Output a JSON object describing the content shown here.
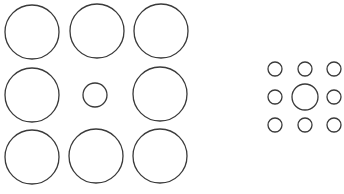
{
  "diagram": {
    "type": "ebbinghaus-illusion",
    "stroke_color": "#3a3a3a",
    "background": "#ffffff",
    "left_group": {
      "center_circle": {
        "cx": 95,
        "cy": 95,
        "r": 12
      },
      "surrounding_circles": [
        {
          "cx": 32,
          "cy": 32,
          "r": 27
        },
        {
          "cx": 97,
          "cy": 31,
          "r": 27
        },
        {
          "cx": 161,
          "cy": 31,
          "r": 27
        },
        {
          "cx": 32,
          "cy": 95,
          "r": 27
        },
        {
          "cx": 160,
          "cy": 94,
          "r": 27
        },
        {
          "cx": 32,
          "cy": 157,
          "r": 27
        },
        {
          "cx": 96,
          "cy": 156,
          "r": 27
        },
        {
          "cx": 160,
          "cy": 156,
          "r": 27
        }
      ]
    },
    "right_group": {
      "center_circle": {
        "cx": 305,
        "cy": 97,
        "r": 13
      },
      "surrounding_circles": [
        {
          "cx": 275,
          "cy": 69,
          "r": 7
        },
        {
          "cx": 305,
          "cy": 69,
          "r": 7
        },
        {
          "cx": 334,
          "cy": 69,
          "r": 7
        },
        {
          "cx": 275,
          "cy": 97,
          "r": 7
        },
        {
          "cx": 334,
          "cy": 97,
          "r": 7
        },
        {
          "cx": 275,
          "cy": 125,
          "r": 7
        },
        {
          "cx": 305,
          "cy": 125,
          "r": 7
        },
        {
          "cx": 334,
          "cy": 125,
          "r": 7
        }
      ]
    }
  }
}
